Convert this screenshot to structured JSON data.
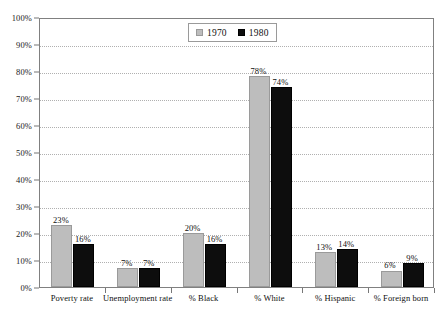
{
  "chart_data": {
    "type": "bar",
    "title": "",
    "subtitle": "",
    "xlabel": "",
    "ylabel": "",
    "ylim": [
      0,
      100
    ],
    "y_tick_labels": [
      "0%",
      "10%",
      "20%",
      "30%",
      "40%",
      "50%",
      "60%",
      "70%",
      "80%",
      "90%",
      "100%"
    ],
    "y_tick_values": [
      0,
      10,
      20,
      30,
      40,
      50,
      60,
      70,
      80,
      90,
      100
    ],
    "grid": true,
    "legend_position": "top-center",
    "categories": [
      "Poverty rate",
      "Unemployment rate",
      "% Black",
      "% White",
      "% Hispanic",
      "% Foreign born"
    ],
    "series": [
      {
        "name": "1970",
        "color": "#bdbdbd",
        "values": [
          23,
          7,
          20,
          78,
          13,
          6
        ],
        "labels": [
          "23%",
          "7%",
          "20%",
          "78%",
          "13%",
          "6%"
        ]
      },
      {
        "name": "1980",
        "color": "#0d0d0d",
        "values": [
          16,
          7,
          16,
          74,
          14,
          9
        ],
        "labels": [
          "16%",
          "7%",
          "16%",
          "74%",
          "14%",
          "9%"
        ]
      }
    ]
  },
  "legend": {
    "entries": [
      {
        "label": "1970",
        "swatch": "legend-swatch-1970"
      },
      {
        "label": "1980",
        "swatch": "legend-swatch-1980"
      }
    ]
  }
}
